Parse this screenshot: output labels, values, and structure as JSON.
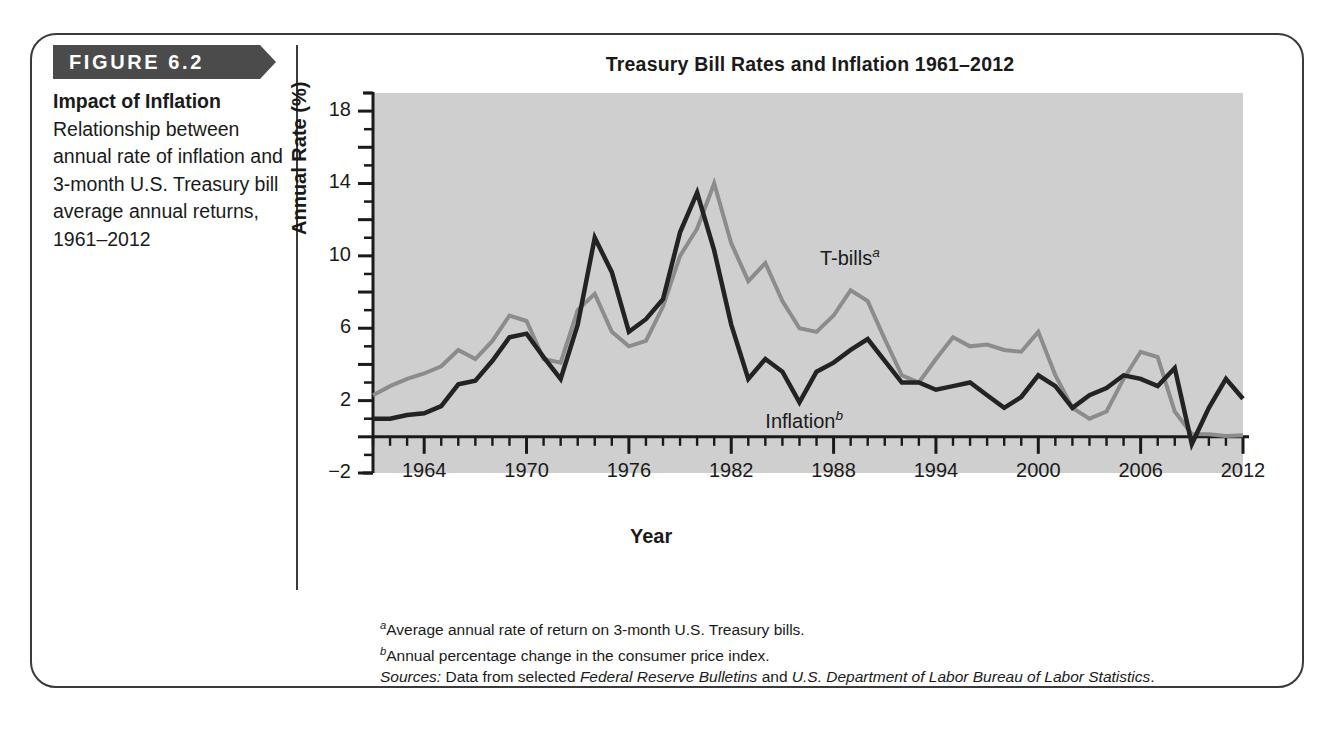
{
  "figure": {
    "tag": "FIGURE 6.2",
    "caption_title": "Impact of Inflation",
    "caption_body": "Relationship between annual rate of inflation and 3-month U.S. Treasury bill average annual returns, 1961–2012"
  },
  "footnotes": {
    "a_marker": "a",
    "a_text": "Average annual rate of return on 3-month U.S. Treasury bills.",
    "b_marker": "b",
    "b_text": "Annual percentage change in the consumer price index.",
    "sources_label": "Sources:",
    "sources_pre": " Data from selected ",
    "sources_italic_1": "Federal Reserve Bulletins",
    "sources_mid": " and ",
    "sources_italic_2": "U.S. Department of Labor Bureau of Labor Statistics",
    "sources_end": "."
  },
  "chart_data": {
    "type": "line",
    "title": "Treasury Bill Rates and Inflation 1961–2012",
    "xlabel": "Year",
    "ylabel": "Annual Rate (%)",
    "xlim": [
      1961,
      2012
    ],
    "ylim": [
      -2,
      19
    ],
    "ytick_labels": [
      "18",
      "14",
      "10",
      "6",
      "2",
      "−2"
    ],
    "ytick_values": [
      18,
      14,
      10,
      6,
      2,
      -2
    ],
    "ytick_major_step": 2,
    "ytick_minor_step": 1,
    "xtick_labels": [
      "1964",
      "1970",
      "1976",
      "1982",
      "1988",
      "1994",
      "2000",
      "2006",
      "2012"
    ],
    "xtick_values": [
      1964,
      1970,
      1976,
      1982,
      1988,
      1994,
      2000,
      2006,
      2012
    ],
    "xtick_minor_step": 1,
    "grid": false,
    "legend_position": "inline-annotation",
    "plot_background": "#cfcfcf",
    "annotations": [
      {
        "name": "tbills",
        "text": "T-bills",
        "sup": "a",
        "x": 1987.2,
        "y": 10.6,
        "color": "#8c8c8c"
      },
      {
        "name": "inflation",
        "text": "Inflation",
        "sup": "b",
        "x": 1984.0,
        "y": 1.6,
        "color": "#232323"
      }
    ],
    "x": [
      1961,
      1962,
      1963,
      1964,
      1965,
      1966,
      1967,
      1968,
      1969,
      1970,
      1971,
      1972,
      1973,
      1974,
      1975,
      1976,
      1977,
      1978,
      1979,
      1980,
      1981,
      1982,
      1983,
      1984,
      1985,
      1986,
      1987,
      1988,
      1989,
      1990,
      1991,
      1992,
      1993,
      1994,
      1995,
      1996,
      1997,
      1998,
      1999,
      2000,
      2001,
      2002,
      2003,
      2004,
      2005,
      2006,
      2007,
      2008,
      2009,
      2010,
      2011,
      2012
    ],
    "series": [
      {
        "name": "T-bills",
        "label": "T-bills",
        "footnote": "a",
        "color": "#8c8c8c",
        "linewidth": 4,
        "values": [
          2.3,
          2.8,
          3.2,
          3.5,
          3.9,
          4.8,
          4.3,
          5.3,
          6.7,
          6.4,
          4.3,
          4.1,
          7.0,
          7.9,
          5.8,
          5.0,
          5.3,
          7.2,
          10.0,
          11.5,
          14.0,
          10.7,
          8.6,
          9.6,
          7.5,
          6.0,
          5.8,
          6.7,
          8.1,
          7.5,
          5.4,
          3.4,
          3.0,
          4.3,
          5.5,
          5.0,
          5.1,
          4.8,
          4.7,
          5.8,
          3.4,
          1.6,
          1.0,
          1.4,
          3.2,
          4.7,
          4.4,
          1.4,
          0.15,
          0.14,
          0.05,
          0.09
        ]
      },
      {
        "name": "Inflation",
        "label": "Inflation",
        "footnote": "b",
        "color": "#232323",
        "linewidth": 4.5,
        "values": [
          1.0,
          1.0,
          1.2,
          1.3,
          1.7,
          2.9,
          3.1,
          4.2,
          5.5,
          5.7,
          4.4,
          3.2,
          6.2,
          11.0,
          9.1,
          5.8,
          6.5,
          7.6,
          11.3,
          13.5,
          10.3,
          6.2,
          3.2,
          4.3,
          3.6,
          1.9,
          3.6,
          4.1,
          4.8,
          5.4,
          4.2,
          3.0,
          3.0,
          2.6,
          2.8,
          3.0,
          2.3,
          1.6,
          2.2,
          3.4,
          2.8,
          1.6,
          2.3,
          2.7,
          3.4,
          3.2,
          2.8,
          3.8,
          -0.4,
          1.6,
          3.2,
          2.1
        ]
      }
    ]
  }
}
